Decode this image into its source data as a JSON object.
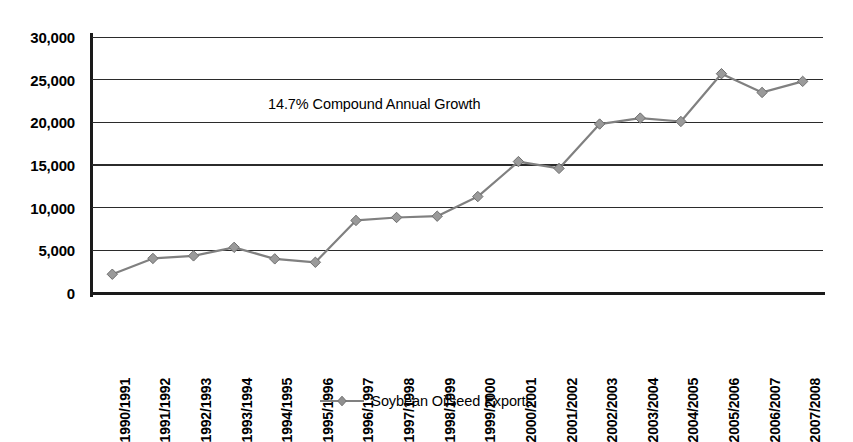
{
  "chart_data": {
    "type": "line",
    "title": "",
    "subtitle": "",
    "xlabel": "",
    "ylabel": "",
    "categories": [
      "1990/1991",
      "1991/1992",
      "1992/1993",
      "1993/1994",
      "1994/1995",
      "1995/1996",
      "1996/1997",
      "1997/1998",
      "1998/1999",
      "1999/2000",
      "2000/2001",
      "2001/2002",
      "2002/2003",
      "2003/2004",
      "2004/2005",
      "2005/2006",
      "2006/2007",
      "2007/2008"
    ],
    "series": [
      {
        "name": "Soybean Oilseed Exports",
        "color": "#808080",
        "marker": "diamond",
        "values": [
          2200,
          4050,
          4350,
          5350,
          4000,
          3600,
          8500,
          8850,
          9000,
          11300,
          15400,
          14600,
          19800,
          20500,
          20100,
          25700,
          23500,
          24800
        ]
      }
    ],
    "ylim": [
      0,
      30000
    ],
    "ytick_labels": [
      "30,000",
      "25,000",
      "20,000",
      "15,000",
      "10,000",
      "5,000",
      "0"
    ],
    "ytick_values": [
      30000,
      25000,
      20000,
      15000,
      10000,
      5000,
      0
    ],
    "grid": "horizontal",
    "legend_position": "bottom-center",
    "annotations": [
      {
        "text": "14.7% Compound Annual Growth",
        "x": "1994/1995",
        "y": 21500
      }
    ]
  },
  "legend": {
    "entries": [
      {
        "label": "Soybean Oilseed Exports",
        "color": "#808080"
      }
    ]
  },
  "annotation": {
    "growth_text": "14.7% Compound Annual Growth"
  },
  "colors": {
    "series": "#808080",
    "axis": "#1a1a1a",
    "gridline": "#2b2b2b",
    "background": "#ffffff"
  }
}
